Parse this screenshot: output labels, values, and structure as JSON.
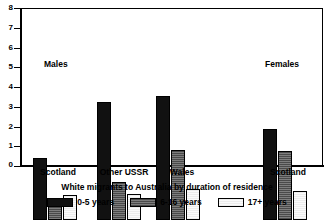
{
  "chart_data": {
    "type": "bar",
    "title": "",
    "xlabel": "White migrants to Australia by duration of residence",
    "ylabel": "",
    "ylim": [
      0,
      8
    ],
    "yticks": [
      "0",
      "1",
      "2",
      "3",
      "4",
      "5",
      "6",
      "7",
      "8"
    ],
    "grid": false,
    "legend_position": "bottom",
    "categories": [
      "Scotland",
      "Other USSR",
      "Wales",
      "Scotland"
    ],
    "series": [
      {
        "name": "0-5 years",
        "values": [
          3.15,
          6.0,
          6.3,
          4.6
        ]
      },
      {
        "name": "6-16 years",
        "values": [
          1.0,
          1.95,
          3.55,
          3.5
        ]
      },
      {
        "name": "17+ years",
        "values": [
          1.25,
          1.3,
          1.55,
          1.45
        ]
      }
    ],
    "annotations": [
      {
        "text": "Males",
        "x_category": "Scotland",
        "value": 5.4
      },
      {
        "text": "Females",
        "x_category": "Scotland",
        "value": 5.4
      }
    ]
  },
  "caption": {
    "text": "White migrants to Australia by duration of residence"
  },
  "axis": {
    "y_labels": [
      "8",
      "7",
      "6",
      "5",
      "4",
      "3",
      "2",
      "1",
      "0"
    ],
    "x_labels": [
      "Scotland",
      "Other USSR",
      "Wales",
      "Scotland"
    ]
  },
  "annotations": {
    "males": "Males",
    "females": "Females"
  },
  "legend": {
    "items": [
      {
        "label": "0-5 years",
        "color": "#111111",
        "pattern": "solid-black"
      },
      {
        "label": "6-16 years",
        "color": "#5a5a5a",
        "pattern": "horizontal-hatch-dark"
      },
      {
        "label": "17+ years",
        "color": "#ececec",
        "pattern": "horizontal-hatch-light"
      }
    ]
  },
  "colors": {
    "series_0": "#111111",
    "series_1": "#5a5a5a",
    "series_2": "#ececec",
    "axis": "#000000",
    "background": "#ffffff"
  }
}
